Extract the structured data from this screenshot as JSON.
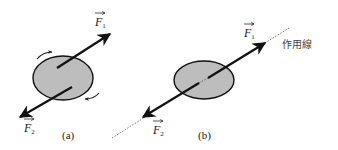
{
  "figure": {
    "type": "physics-force-diagram",
    "colors": {
      "body_fill": "#bdbdbd",
      "stroke": "#111111",
      "dotted": "#555555",
      "background": "#ffffff"
    }
  },
  "panel_a": {
    "caption": "(a)",
    "force1": {
      "symbol": "F",
      "subscript": "1"
    },
    "force2": {
      "symbol": "F",
      "subscript": "2"
    },
    "rotation_arrows": [
      "rotation-upper-left",
      "rotation-lower-right"
    ]
  },
  "panel_b": {
    "caption": "(b)",
    "force1": {
      "symbol": "F",
      "subscript": "1"
    },
    "force2": {
      "symbol": "F",
      "subscript": "2"
    },
    "line_of_action_label": "作用線"
  }
}
